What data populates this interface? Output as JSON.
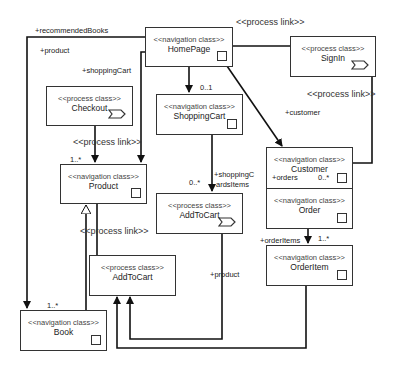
{
  "diagram": {
    "type": "UML navigation/process class diagram",
    "nodes": [
      {
        "id": "homepage",
        "stereotype": "<<navigation class>>",
        "name": "HomePage",
        "kind": "navigation"
      },
      {
        "id": "signin",
        "stereotype": "<<process class>>",
        "name": "SignIn",
        "kind": "process"
      },
      {
        "id": "checkout",
        "stereotype": "<<process class>>",
        "name": "Checkout",
        "kind": "process"
      },
      {
        "id": "shoppingcart",
        "stereotype": "<<navigation class>>",
        "name": "ShoppingCart",
        "kind": "navigation"
      },
      {
        "id": "customer",
        "stereotype": "<<navigation class>>",
        "name": "Customer",
        "kind": "navigation"
      },
      {
        "id": "product",
        "stereotype": "<<navigation class>>",
        "name": "Product",
        "kind": "navigation"
      },
      {
        "id": "addtocart_cart",
        "stereotype": "<<process class>>",
        "name": "AddToCart",
        "kind": "process"
      },
      {
        "id": "order",
        "stereotype": "<<navigation class>>",
        "name": "Order",
        "kind": "navigation"
      },
      {
        "id": "orderitem",
        "stereotype": "<<navigation class>>",
        "name": "OrderItem",
        "kind": "navigation"
      },
      {
        "id": "addtocart_product",
        "stereotype": "<<process class>>",
        "name": "AddToCart",
        "kind": "process"
      },
      {
        "id": "book",
        "stereotype": "<<navigation class>>",
        "name": "Book",
        "kind": "navigation"
      }
    ],
    "labels": {
      "recommended_books": "+recommendedBooks",
      "product_role": "+product",
      "shopping_cart_role": "+shoppingCart",
      "mult_0_1": "0..1",
      "customer_role": "+customer",
      "mult_1_star_product": "1..*",
      "mult_0_star_cartitems": "0..*",
      "shopping_cart_items_1": "+shoppingC",
      "shopping_cart_items_2": "ardsItems",
      "orders_role": "+orders",
      "mult_0_star_orders": "0..*",
      "order_items_role": "+orderItems",
      "mult_1_star_orderitems": "1..*",
      "product_role_bottom": "+product",
      "mult_1_star_book": "1..*"
    },
    "process_links": {
      "top": "<<process link>>",
      "signin_customer": "<<process link>>",
      "checkout_product": "<<process link>>",
      "product_addtocart": "<<process link>>"
    }
  }
}
